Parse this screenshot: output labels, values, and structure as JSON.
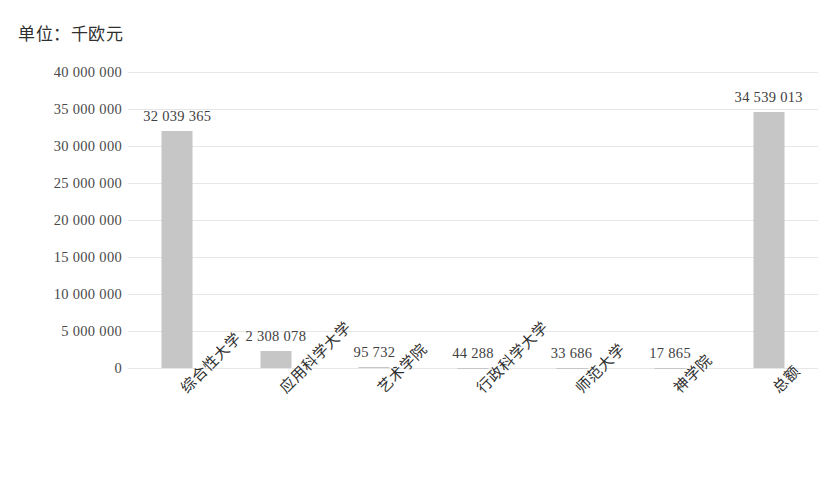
{
  "chart_data": {
    "type": "bar",
    "title": "单位：千欧元",
    "xlabel": "",
    "ylabel": "",
    "ylim": [
      0,
      40000000
    ],
    "grid": true,
    "legend": false,
    "categories": [
      "综合性大学",
      "应用科学大学",
      "艺术学院",
      "行政科学大学",
      "师范大学",
      "神学院",
      "总额"
    ],
    "values": [
      32039365,
      2308078,
      95732,
      44288,
      33686,
      17865,
      34539013
    ],
    "value_labels": [
      "32 039 365",
      "2 308 078",
      "95 732",
      "44 288",
      "33 686",
      "17 865",
      "34 539 013"
    ],
    "y_ticks": [
      40000000,
      35000000,
      30000000,
      25000000,
      20000000,
      15000000,
      10000000,
      5000000,
      0
    ],
    "y_tick_labels": [
      "40 000 000",
      "35 000 000",
      "30 000 000",
      "25 000 000",
      "20 000 000",
      "15 000 000",
      "10 000 000",
      "5 000 000",
      "0"
    ],
    "bar_color": "#c6c6c6",
    "grid_color": "#e6e6e6",
    "text_color": "#3a3a3a"
  }
}
